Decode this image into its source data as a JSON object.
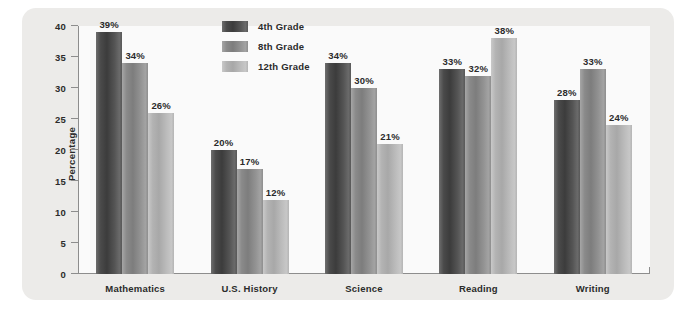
{
  "chart_data": {
    "type": "bar",
    "title": "",
    "xlabel": "",
    "ylabel": "Percentage",
    "ylim": [
      0,
      40
    ],
    "yticks": [
      0,
      5,
      10,
      15,
      20,
      25,
      30,
      35,
      40
    ],
    "ytick_labels": [
      "0",
      "5",
      "10",
      "15",
      "20",
      "25",
      "30",
      "35",
      "40"
    ],
    "grid": false,
    "legend_position": "top-center",
    "value_label_suffix": "%",
    "categories": [
      "Mathematics",
      "U.S. History",
      "Science",
      "Reading",
      "Writing"
    ],
    "series": [
      {
        "name": "4th Grade",
        "color": "#4a4a4a",
        "values": [
          39,
          20,
          34,
          33,
          28
        ],
        "labels": [
          "39%",
          "20%",
          "34%",
          "33%",
          "28%"
        ]
      },
      {
        "name": "8th Grade",
        "color": "#8a8a8a",
        "values": [
          34,
          17,
          30,
          32,
          33
        ],
        "labels": [
          "34%",
          "17%",
          "30%",
          "32%",
          "33%"
        ]
      },
      {
        "name": "12th Grade",
        "color": "#b3b3b3",
        "values": [
          26,
          12,
          21,
          38,
          24
        ],
        "labels": [
          "26%",
          "12%",
          "21%",
          "38%",
          "24%"
        ]
      }
    ]
  },
  "panel": {
    "background_color": "#ecebe9",
    "plot_background_color": "#fafafa",
    "axis_color": "#8d8d8d"
  }
}
